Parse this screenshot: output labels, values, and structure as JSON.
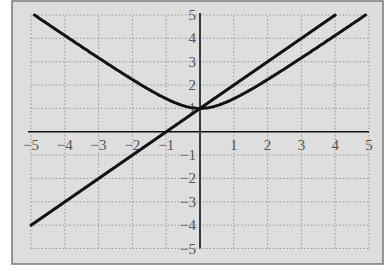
{
  "chart_data": {
    "type": "line",
    "title": "",
    "xlabel": "",
    "ylabel": "",
    "xlim": [
      -5,
      5
    ],
    "ylim": [
      -5,
      5
    ],
    "grid": true,
    "x_ticks": [
      -5,
      -4,
      -3,
      -2,
      -1,
      1,
      2,
      3,
      4,
      5
    ],
    "y_ticks": [
      -5,
      -4,
      -3,
      -2,
      -1,
      1,
      2,
      3,
      4,
      5
    ],
    "x_tick_labels": [
      "−5",
      "−4",
      "−3",
      "−2",
      "−1",
      "1",
      "2",
      "3",
      "4",
      "5"
    ],
    "y_tick_labels": [
      "−5",
      "−4",
      "−3",
      "−2",
      "−1",
      "1",
      "2",
      "3",
      "4",
      "5"
    ],
    "series": [
      {
        "name": "line y = x + 1",
        "x": [
          -5,
          4
        ],
        "y": [
          -4,
          5
        ]
      },
      {
        "name": "curve y = sqrt(x^2 + 1)",
        "x": [
          -4.9,
          -4,
          -3,
          -2,
          -1,
          -0.5,
          0,
          0.5,
          1,
          2,
          3,
          4,
          4.9
        ],
        "y": [
          5.0,
          4.12,
          3.16,
          2.24,
          1.41,
          1.12,
          1.0,
          1.12,
          1.41,
          2.24,
          3.16,
          4.12,
          5.0
        ]
      }
    ],
    "colors": {
      "background": "#dedede",
      "lines": "#111111",
      "grid": "#9a9a9a"
    }
  }
}
